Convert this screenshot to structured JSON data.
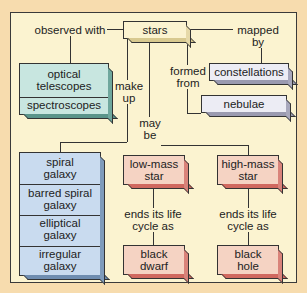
{
  "diagram": {
    "type": "concept-map",
    "central_node": "stars",
    "links": {
      "observed_with": "observed with",
      "mapped_by": "mapped by",
      "make_up": "make up",
      "formed_from": "formed from",
      "may_be": "may be",
      "ends_life_low": "ends its life cycle as",
      "ends_life_high": "ends its life cycle as"
    },
    "nodes": {
      "stars": "stars",
      "optical_telescopes": "optical telescopes",
      "spectroscopes": "spectroscopes",
      "constellations": "constellations",
      "nebulae": "nebulae",
      "spiral_galaxy": "spiral galaxy",
      "barred_spiral_galaxy": "barred spiral galaxy",
      "elliptical_galaxy": "elliptical galaxy",
      "irregular_galaxy": "irregular galaxy",
      "low_mass_star": "low-mass star",
      "high_mass_star": "high-mass star",
      "black_dwarf": "black dwarf",
      "black_hole": "black hole"
    },
    "colors": {
      "background": "#f7dcae",
      "panel": "#fbf3d0",
      "teal": "#c8e6e0",
      "grey": "#ececf4",
      "blue": "#c9dbef",
      "pink": "#f5d3c3"
    }
  }
}
